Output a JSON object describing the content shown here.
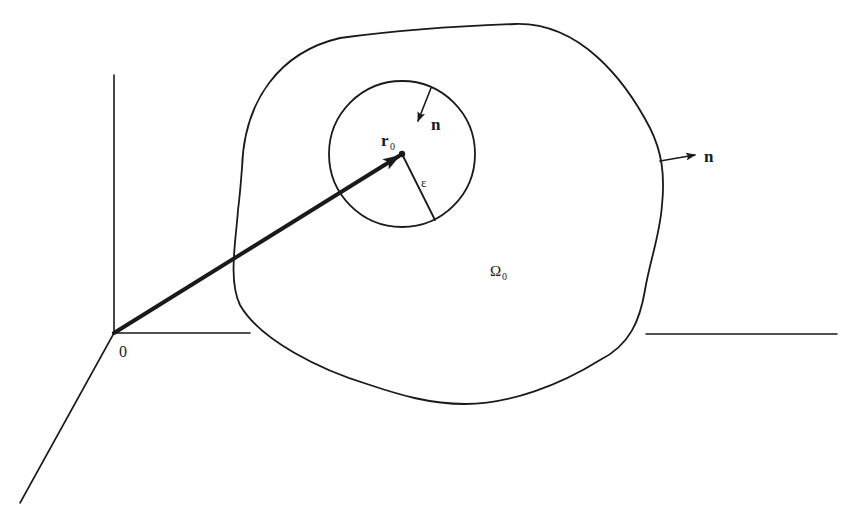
{
  "figure": {
    "type": "geometric-diagram"
  },
  "labels": {
    "origin": "0",
    "position_vector": "r",
    "position_vector_sub": "0",
    "inner_normal": "n",
    "radius": "ε",
    "outer_normal": "n",
    "region": "Ω",
    "region_sub": "0"
  },
  "colors": {
    "stroke": "#1a1a1a",
    "background": "#ffffff"
  }
}
